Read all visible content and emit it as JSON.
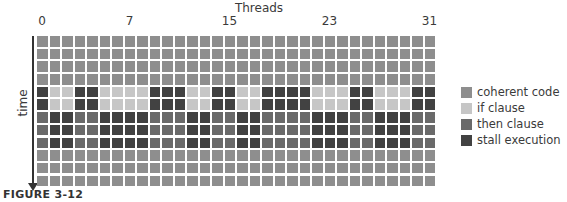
{
  "title": "Threads",
  "axis": {
    "x_ticks": [
      {
        "label": "0",
        "col": 0
      },
      {
        "label": "7",
        "col": 7
      },
      {
        "label": "15",
        "col": 15
      },
      {
        "label": "23",
        "col": 23
      },
      {
        "label": "31",
        "col": 31
      }
    ],
    "y_label": "time"
  },
  "colors": {
    "C": "#8e8e8e",
    "I": "#c6c6c6",
    "T": "#6a6a6a",
    "S": "#424242"
  },
  "legend": [
    {
      "key": "C",
      "label": "coherent code"
    },
    {
      "key": "I",
      "label": "if clause"
    },
    {
      "key": "T",
      "label": "then clause"
    },
    {
      "key": "S",
      "label": "stall execution"
    }
  ],
  "grid": {
    "columns": 32,
    "rows": [
      "CCCCCCCCCCCCCCCCCCCCCCCCCCCCCCCC",
      "CCCCCCCCCCCCCCCCCCCCCCCCCCCCCCCC",
      "CCCCCCCCCCCCCCCCCCCCCCCCCCCCCCCC",
      "CCCCCCCCCCCCCCCCCCCCCCCCCCCCCCCC",
      "SIISSIIIISSSIISSIISSSSIIISSIIISS",
      "SIISSIIIISSSIISSIISSSSIIISSIIISS",
      "TSSTTSSSSTTTSSTTSSTTTTSSSTTSSSTT",
      "TSSTTSSSSTTTSSTTSSTTTTSSSTTSSSTT",
      "TSSTTSSSSTTTSSTTSSTTTTSSSTTSSSTT",
      "CCCCCCCCCCCCCCCCCCCCCCCCCCCCCCCC",
      "CCCCCCCCCCCCCCCCCCCCCCCCCCCCCCCC",
      "CCCCCCCCCCCCCCCCCCCCCCCCCCCCCCCC"
    ]
  },
  "caption": "FIGURE 3-12"
}
